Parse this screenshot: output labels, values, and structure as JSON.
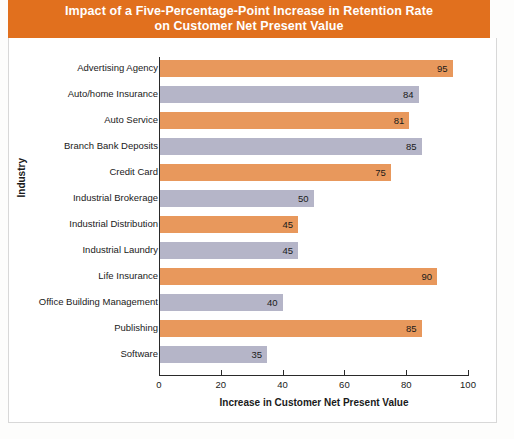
{
  "banner": {
    "title_line1": "Impact of a Five-Percentage-Point Increase in Retention Rate",
    "title_line2": "on Customer Net Present Value",
    "background_color": "#e1701e",
    "text_color": "#ffffff"
  },
  "colors": {
    "orange_bar": "#e8985c",
    "gray_bar": "#b5b5c8",
    "axis": "#2a2a2a",
    "text": "#1a1a1a"
  },
  "chart_data": {
    "type": "bar",
    "orientation": "horizontal",
    "title": "Impact of a Five-Percentage-Point Increase in Retention Rate on Customer Net Present Value",
    "xlabel": "Increase in Customer Net Present Value",
    "ylabel": "Industry",
    "xlim": [
      0,
      100
    ],
    "xticks": [
      0,
      20,
      40,
      60,
      80,
      100
    ],
    "xtick_labels": [
      "0",
      "20",
      "40",
      "60",
      "80",
      "100"
    ],
    "grid": false,
    "legend": "none",
    "categories": [
      "Advertising Agency",
      "Auto/home Insurance",
      "Auto Service",
      "Branch Bank Deposits",
      "Credit Card",
      "Industrial Brokerage",
      "Industrial Distribution",
      "Industrial Laundry",
      "Life Insurance",
      "Office Building Management",
      "Publishing",
      "Software"
    ],
    "values": [
      95,
      84,
      81,
      85,
      75,
      50,
      45,
      45,
      90,
      40,
      85,
      35
    ],
    "bar_colors": [
      "#e8985c",
      "#b5b5c8",
      "#e8985c",
      "#b5b5c8",
      "#e8985c",
      "#b5b5c8",
      "#e8985c",
      "#b5b5c8",
      "#e8985c",
      "#b5b5c8",
      "#e8985c",
      "#b5b5c8"
    ],
    "value_labels": [
      "95",
      "84",
      "81",
      "85",
      "75",
      "50",
      "45",
      "45",
      "90",
      "40",
      "85",
      "35"
    ]
  }
}
